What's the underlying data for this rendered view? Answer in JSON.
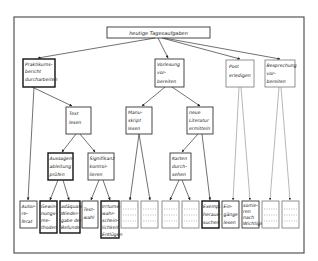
{
  "diagram": {
    "root": {
      "label": "heutige Tagesaufgaben"
    },
    "level1": [
      {
        "id": "praktikum",
        "lines": [
          "Praktikums-",
          "bericht",
          "durcharbeiten"
        ]
      },
      {
        "id": "vorlesung",
        "lines": [
          "Vorlesung",
          "vor-",
          "bereiten"
        ]
      },
      {
        "id": "post",
        "lines": [
          "Post",
          "erledigen"
        ]
      },
      {
        "id": "besprechung",
        "lines": [
          "Besprechung",
          "vor-",
          "bereiten"
        ]
      }
    ],
    "level2": [
      {
        "id": "text",
        "parent": "praktikum",
        "lines": [
          "Text",
          "lesen"
        ]
      },
      {
        "id": "manuskript",
        "parent": "vorlesung",
        "lines": [
          "Manu-",
          "skript",
          "lesen"
        ]
      },
      {
        "id": "literatur",
        "parent": "vorlesung",
        "lines": [
          "neue",
          "Literatur",
          "ermitteln"
        ]
      }
    ],
    "level3": [
      {
        "id": "aussagen",
        "parent": "text",
        "lines": [
          "Aussagen-",
          "ableitung",
          "prüfen"
        ]
      },
      {
        "id": "signifikanz",
        "parent": "text",
        "lines": [
          "Signifikanz",
          "kontrol-",
          "lieren"
        ]
      },
      {
        "id": "karten",
        "parent": "literatur",
        "lines": [
          "Karten",
          "durch-",
          "sehen"
        ]
      }
    ],
    "leaves": [
      {
        "id": "autorreferat",
        "parent": "praktikum",
        "lines": [
          "Autor-",
          "re-",
          "ferat"
        ]
      },
      {
        "id": "gewinnung",
        "parent": "aussagen",
        "lines": [
          "Gewin-",
          "nungs-",
          "me-",
          "thoden"
        ]
      },
      {
        "id": "wiedergabe",
        "parent": "aussagen",
        "lines": [
          "adäquate",
          "Wieder-",
          "gabe der",
          "Befunde"
        ]
      },
      {
        "id": "testwahl",
        "parent": "signifikanz",
        "lines": [
          "Test-",
          "wahl"
        ]
      },
      {
        "id": "irrtum",
        "parent": "signifikanz",
        "lines": [
          "Irrtums-",
          "wahr-",
          "schein-",
          "lichkeit",
          "Entlügen"
        ]
      },
      {
        "id": "blank1",
        "parent": "manuskript",
        "lines": []
      },
      {
        "id": "blank2",
        "parent": "manuskript",
        "lines": []
      },
      {
        "id": "blank3",
        "parent": "karten",
        "lines": []
      },
      {
        "id": "blank4",
        "parent": "karten",
        "lines": []
      },
      {
        "id": "exemplare",
        "parent": "literatur",
        "lines": [
          "Exempl.",
          "heraus-",
          "suchen"
        ]
      },
      {
        "id": "eingaenge",
        "parent": "post",
        "lines": [
          "Ein-",
          "gänge",
          "lesen"
        ]
      },
      {
        "id": "sortieren",
        "parent": "post",
        "lines": [
          "sortie-",
          "ren",
          "nach",
          "Wichtigk."
        ]
      },
      {
        "id": "blank5",
        "parent": "besprechung",
        "lines": []
      },
      {
        "id": "blank6",
        "parent": "besprechung",
        "lines": []
      }
    ]
  },
  "colors": {
    "line": "#333333",
    "background": "#ffffff",
    "frame": "#555555"
  }
}
